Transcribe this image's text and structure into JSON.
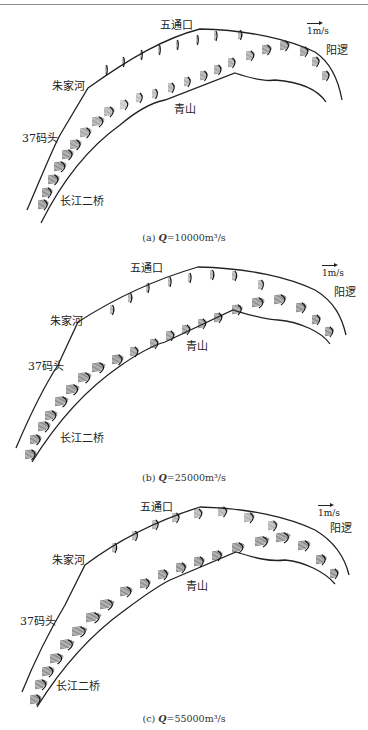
{
  "figure": {
    "scale_label": "1m/s",
    "panels": [
      {
        "id": "a",
        "caption_prefix": "(a) ",
        "caption_var": "Q",
        "caption_value": "=10000m³/s",
        "labels": {
          "wutongkou": "五通口",
          "zhujiahe": "朱家河",
          "matou37": "37码头",
          "changjiang_bridge": "长江二桥",
          "qingshan": "青山",
          "yangluo": "阳逻"
        }
      },
      {
        "id": "b",
        "caption_prefix": "(b) ",
        "caption_var": "Q",
        "caption_value": "=25000m³/s",
        "labels": {
          "wutongkou": "五通口",
          "zhujiahe": "朱家河",
          "matou37": "37码头",
          "changjiang_bridge": "长江二桥",
          "qingshan": "青山",
          "yangluo": "阳逻"
        }
      },
      {
        "id": "c",
        "caption_prefix": "(c) ",
        "caption_var": "Q",
        "caption_value": "=55000m³/s",
        "labels": {
          "wutongkou": "五通口",
          "zhujiahe": "朱家河",
          "matou37": "37码头",
          "changjiang_bridge": "长江二桥",
          "qingshan": "青山",
          "yangluo": "阳逻"
        }
      }
    ]
  }
}
